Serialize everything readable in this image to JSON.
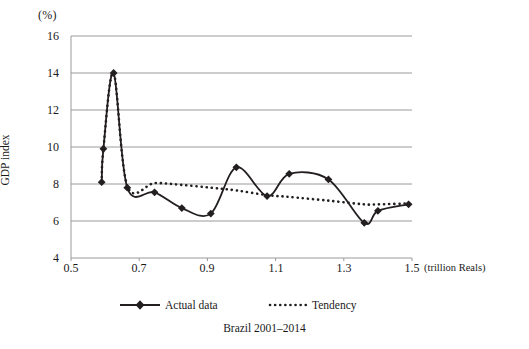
{
  "figure": {
    "caption": "Brazil 2001–2014",
    "y_unit_label": "(%)",
    "x_unit_label": "(trillion Reals)"
  },
  "legend": {
    "position": "bottom",
    "items": [
      {
        "label": "Actual data",
        "marker": "diamond",
        "line": "solid",
        "color": "#231f20"
      },
      {
        "label": "Tendency",
        "marker": "none",
        "line": "dotted",
        "color": "#231f20"
      }
    ]
  },
  "axes": {
    "y_title": "GDP index",
    "y_ticks": [
      "4",
      "6",
      "8",
      "10",
      "12",
      "14",
      "16"
    ],
    "x_ticks": [
      "0.5",
      "0.7",
      "0.9",
      "1.1",
      "1.3",
      "1.5"
    ]
  },
  "colors": {
    "line": "#231f20",
    "grid": "#9a9a9a",
    "axis": "#9a9a9a",
    "background": "#ffffff"
  },
  "chart_data": {
    "type": "line",
    "title": "Brazil 2001–2014",
    "xlabel": "(trillion Reals)",
    "ylabel": "GDP index",
    "y_unit": "(%)",
    "xlim": [
      0.5,
      1.5
    ],
    "ylim": [
      4,
      16
    ],
    "y_tick_values": [
      4,
      6,
      8,
      10,
      12,
      14,
      16
    ],
    "x_tick_values": [
      0.5,
      0.7,
      0.9,
      1.1,
      1.3,
      1.5
    ],
    "grid": "horizontal",
    "legend_position": "bottom",
    "series": [
      {
        "name": "Actual data",
        "line": "solid",
        "marker": "diamond",
        "x": [
          0.59,
          0.595,
          0.625,
          0.665,
          0.745,
          0.825,
          0.91,
          0.985,
          1.075,
          1.14,
          1.255,
          1.36,
          1.4,
          1.49
        ],
        "values": [
          8.1,
          9.9,
          14.0,
          7.8,
          7.55,
          6.7,
          6.4,
          8.9,
          7.35,
          8.55,
          8.25,
          5.9,
          6.55,
          6.9
        ]
      },
      {
        "name": "Tendency",
        "line": "dotted",
        "marker": "none",
        "x": [
          0.59,
          0.595,
          0.625,
          0.665,
          0.745,
          0.825,
          0.91,
          0.985,
          1.075,
          1.14,
          1.255,
          1.36,
          1.4,
          1.49
        ],
        "values": [
          8.1,
          9.9,
          14.0,
          7.9,
          8.05,
          7.95,
          7.8,
          7.65,
          7.4,
          7.3,
          7.1,
          6.9,
          6.9,
          6.95
        ]
      }
    ]
  }
}
